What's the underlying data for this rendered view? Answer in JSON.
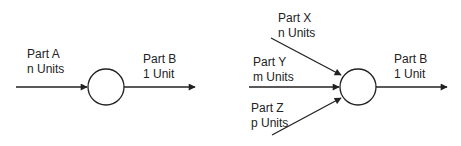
{
  "diagrams": [
    {
      "name": "single-input",
      "inputs": [
        {
          "part": "Part A",
          "qty": "n Units"
        }
      ],
      "output": {
        "part": "Part B",
        "qty": "1 Unit"
      }
    },
    {
      "name": "multi-input",
      "inputs": [
        {
          "part": "Part X",
          "qty": "n Units"
        },
        {
          "part": "Part Y",
          "qty": "m Units"
        },
        {
          "part": "Part Z",
          "qty": "p Units"
        }
      ],
      "output": {
        "part": "Part B",
        "qty": "1 Unit"
      }
    }
  ],
  "colors": {
    "stroke": "#222222",
    "fill": "#ffffff"
  }
}
